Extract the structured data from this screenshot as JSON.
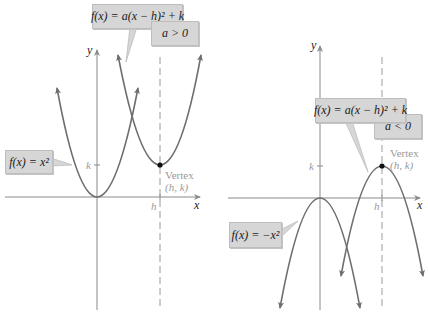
{
  "left_graph": {
    "axis_x_label": "x",
    "axis_y_label": "y",
    "tick_k": "k",
    "tick_h": "h",
    "vertex_label": "Vertex",
    "vertex_coords": "(h, k)",
    "general_formula": "f(x) = a(x − h)² + k",
    "condition": "a > 0",
    "base_formula": "f(x) = x²"
  },
  "right_graph": {
    "axis_x_label": "x",
    "axis_y_label": "y",
    "tick_k": "k",
    "tick_h": "h",
    "vertex_label": "Vertex",
    "vertex_coords": "(h, k)",
    "general_formula": "f(x) = a(x − h)² + k",
    "condition": "a < 0",
    "base_formula": "f(x) = −x²"
  },
  "colors": {
    "curve": "#6e6e70",
    "axis": "#8a8a8a",
    "box_fill": "#d6d6d6",
    "label_gray": "#9a9a9a",
    "vertex_dot": "#111111"
  }
}
